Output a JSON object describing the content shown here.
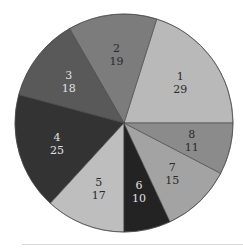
{
  "chart_data": {
    "type": "pie",
    "title": "",
    "start_angle_deg": 0,
    "direction": "counterclockwise",
    "categories": [
      "1",
      "2",
      "3",
      "4",
      "5",
      "6",
      "7",
      "8"
    ],
    "values": [
      29,
      19,
      18,
      25,
      17,
      10,
      15,
      11
    ],
    "colors": [
      "#b9b9b9",
      "#7c7c7c",
      "#595959",
      "#333333",
      "#bebebe",
      "#232323",
      "#a3a3a3",
      "#8b8b8b"
    ],
    "label_colors": [
      "#2a2a2a",
      "#2a2a2a",
      "#e0e0e0",
      "#e0e0e0",
      "#2a2a2a",
      "#e0e0e0",
      "#2a2a2a",
      "#2a2a2a"
    ],
    "legend": null,
    "grid": false
  },
  "layout": {
    "center_x": 124,
    "center_y": 123,
    "radius": 109,
    "label_radius_fraction": 0.64,
    "edge_color": "#444444"
  }
}
